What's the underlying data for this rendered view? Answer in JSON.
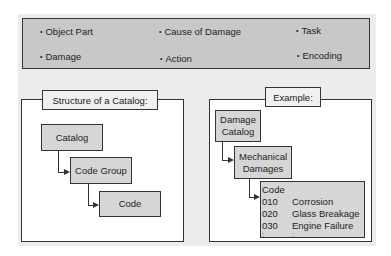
{
  "categories": {
    "items": [
      "Object Part",
      "Cause of Damage",
      "Task",
      "Damage",
      "Action",
      "Encoding"
    ]
  },
  "structure_panel": {
    "title": "Structure of a Catalog:",
    "nodes": [
      "Catalog",
      "Code Group",
      "Code"
    ]
  },
  "example_panel": {
    "title": "Example:",
    "catalog": "Damage Catalog",
    "code_group": "Mechanical Damages",
    "code_header": "Code",
    "codes": [
      {
        "num": "010",
        "label": "Corrosion"
      },
      {
        "num": "020",
        "label": "Glass Breakage"
      },
      {
        "num": "030",
        "label": "Engine Failure"
      }
    ],
    "continuation": ":"
  }
}
